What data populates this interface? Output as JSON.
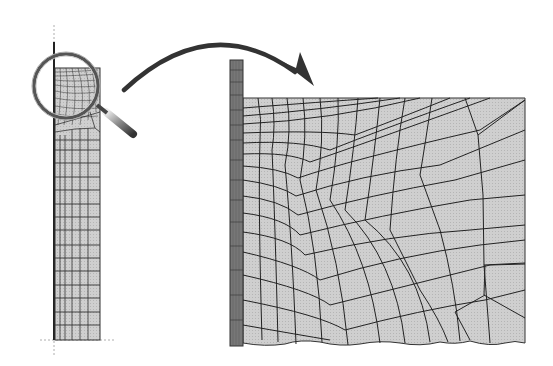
{
  "figure": {
    "description": "Finite element mesh refinement illustration: a slender column mesh with a magnifying glass over its top corner, and a curved arrow pointing to an enlarged view of the refined corner mesh",
    "colors": {
      "background": "#ffffff",
      "mesh_fill": "#c8c8c8",
      "mesh_lines": "#2a2a2a",
      "arrow": "#3a3a3a",
      "magnifier_rim": "#555555",
      "axis_dashed": "#999999"
    },
    "left_model": {
      "label": "full-column-mesh",
      "columns": 5,
      "rows": 18
    },
    "magnifier": {
      "label": "magnifying-glass"
    },
    "arrow": {
      "label": "zoom-arrow"
    },
    "right_model": {
      "label": "enlarged-corner-mesh"
    }
  }
}
